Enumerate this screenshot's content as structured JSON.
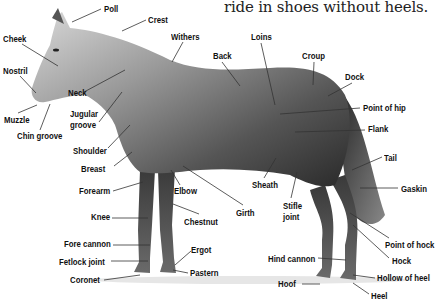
{
  "caption": "ride in shoes without heels.",
  "diagram": {
    "labels": [
      {
        "id": "poll",
        "text": "Poll",
        "x": 104,
        "y": 4
      },
      {
        "id": "crest",
        "text": "Crest",
        "x": 148,
        "y": 15
      },
      {
        "id": "cheek",
        "text": "Cheek",
        "x": 3,
        "y": 34
      },
      {
        "id": "withers",
        "text": "Withers",
        "x": 171,
        "y": 32
      },
      {
        "id": "loins",
        "text": "Loins",
        "x": 251,
        "y": 32
      },
      {
        "id": "back",
        "text": "Back",
        "x": 213,
        "y": 51
      },
      {
        "id": "croup",
        "text": "Croup",
        "x": 302,
        "y": 51
      },
      {
        "id": "nostril",
        "text": "Nostril",
        "x": 3,
        "y": 66
      },
      {
        "id": "dock",
        "text": "Dock",
        "x": 345,
        "y": 72
      },
      {
        "id": "neck",
        "text": "Neck",
        "x": 68,
        "y": 88
      },
      {
        "id": "point-of-hip",
        "text": "Point of hip",
        "x": 363,
        "y": 103
      },
      {
        "id": "jugular-groove-1",
        "text": "Jugular",
        "x": 70,
        "y": 109
      },
      {
        "id": "jugular-groove-2",
        "text": "groove",
        "x": 70,
        "y": 120
      },
      {
        "id": "muzzle",
        "text": "Muzzle",
        "x": 4,
        "y": 115
      },
      {
        "id": "flank",
        "text": "Flank",
        "x": 368,
        "y": 124
      },
      {
        "id": "chin-groove",
        "text": "Chin groove",
        "x": 17,
        "y": 131
      },
      {
        "id": "shoulder",
        "text": "Shoulder",
        "x": 73,
        "y": 146
      },
      {
        "id": "tail",
        "text": "Tail",
        "x": 384,
        "y": 153
      },
      {
        "id": "breast",
        "text": "Breast",
        "x": 81,
        "y": 164
      },
      {
        "id": "sheath",
        "text": "Sheath",
        "x": 252,
        "y": 180
      },
      {
        "id": "gaskin",
        "text": "Gaskin",
        "x": 401,
        "y": 184
      },
      {
        "id": "forearm",
        "text": "Forearm",
        "x": 79,
        "y": 186
      },
      {
        "id": "elbow",
        "text": "Elbow",
        "x": 174,
        "y": 186
      },
      {
        "id": "stifle-joint-1",
        "text": "Stifle",
        "x": 283,
        "y": 201
      },
      {
        "id": "stifle-joint-2",
        "text": "joint",
        "x": 283,
        "y": 212
      },
      {
        "id": "girth",
        "text": "Girth",
        "x": 236,
        "y": 208
      },
      {
        "id": "knee",
        "text": "Knee",
        "x": 91,
        "y": 212
      },
      {
        "id": "chestnut",
        "text": "Chestnut",
        "x": 184,
        "y": 217
      },
      {
        "id": "point-of-hock",
        "text": "Point of hock",
        "x": 385,
        "y": 240
      },
      {
        "id": "fore-cannon",
        "text": "Fore cannon",
        "x": 64,
        "y": 239
      },
      {
        "id": "ergot",
        "text": "Ergot",
        "x": 191,
        "y": 245
      },
      {
        "id": "fetlock-joint",
        "text": "Fetlock joint",
        "x": 59,
        "y": 257
      },
      {
        "id": "hind-cannon",
        "text": "Hind cannon",
        "x": 268,
        "y": 254
      },
      {
        "id": "hock",
        "text": "Hock",
        "x": 392,
        "y": 256
      },
      {
        "id": "pastern",
        "text": "Pastern",
        "x": 190,
        "y": 268
      },
      {
        "id": "coronet",
        "text": "Coronet",
        "x": 70,
        "y": 275
      },
      {
        "id": "hollow-of-heel",
        "text": "Hollow of heel",
        "x": 377,
        "y": 273
      },
      {
        "id": "hoof",
        "text": "Hoof",
        "x": 278,
        "y": 279
      },
      {
        "id": "heel",
        "text": "Heel",
        "x": 371,
        "y": 291
      }
    ],
    "colors": {
      "label": "#111111",
      "leader": "#333333",
      "background": "#ffffff"
    }
  }
}
